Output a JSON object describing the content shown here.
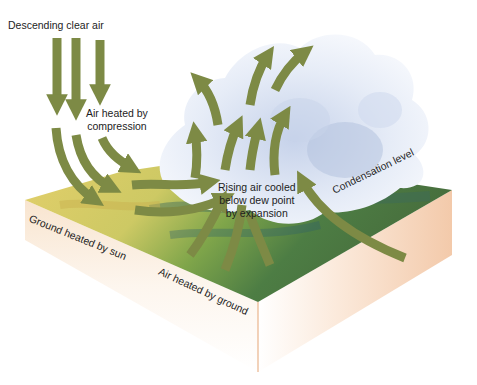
{
  "diagram": {
    "labels": {
      "descending": "Descending clear air",
      "compression_line1": "Air heated by",
      "compression_line2": "compression",
      "rising_line1": "Rising air cooled",
      "rising_line2": "below dew point",
      "rising_line3": "by expansion",
      "condensation": "Condensation level",
      "ground_sun": "Ground heated by sun",
      "air_ground": "Air heated by ground"
    },
    "colors": {
      "arrow": "#7d8a45",
      "cloud": "#eef2fa",
      "cloud_shadow": "#b9c6e2",
      "ground_light": "#d8cf6a",
      "ground_green": "#5f8a3e",
      "ground_dark": "#3f6a3a",
      "side_face": "#f4c9a6"
    }
  }
}
